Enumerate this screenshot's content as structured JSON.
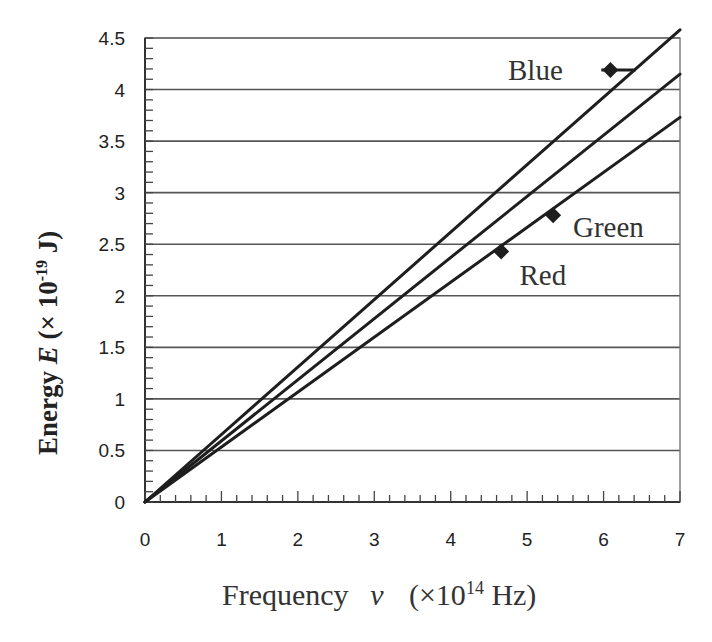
{
  "chart_data": {
    "type": "line",
    "title": "",
    "xlabel": "Frequency  ν  (×10¹⁴ Hz)",
    "xlabel_parts": {
      "main": "Frequency",
      "symbol": "ν",
      "unit_prefix": "(×10",
      "exp": "14",
      "unit_suffix": " Hz)"
    },
    "ylabel": "Energy E (×10⁻¹⁹ J)",
    "ylabel_parts": {
      "main": "Energy ",
      "symbol": "E",
      "unit_prefix": " (× 10",
      "exp": "-19",
      "unit_suffix": " J)"
    },
    "xlim": [
      0,
      7
    ],
    "ylim": [
      0,
      4.5
    ],
    "xticks": [
      0,
      1,
      2,
      3,
      4,
      5,
      6,
      7
    ],
    "yticks": [
      0,
      0.5,
      1,
      1.5,
      2,
      2.5,
      3,
      3.5,
      4,
      4.5
    ],
    "ytick_labels": [
      "0",
      "0.5",
      "1",
      "1.5",
      "2",
      "2.5",
      "3",
      "3.5",
      "4",
      "4.5"
    ],
    "x_minor_step": 0.2,
    "y_minor_step": 0.1,
    "grid": {
      "horizontal": true,
      "vertical": false
    },
    "series": [
      {
        "name": "line-1",
        "type": "line",
        "x": [
          0,
          7
        ],
        "y": [
          0,
          4.58
        ]
      },
      {
        "name": "line-2",
        "type": "line",
        "x": [
          0,
          7
        ],
        "y": [
          0,
          4.15
        ]
      },
      {
        "name": "line-3",
        "type": "line",
        "x": [
          0,
          7
        ],
        "y": [
          0,
          3.73
        ]
      }
    ],
    "points": [
      {
        "name": "Blue",
        "x": 6.09,
        "y": 4.19,
        "xerr": [
          5.97,
          6.42
        ],
        "label_x": 4.75,
        "label_y": 4.19
      },
      {
        "name": "Green",
        "x": 5.34,
        "y": 2.78,
        "label_x": 5.6,
        "label_y": 2.67
      },
      {
        "name": "Red",
        "x": 4.66,
        "y": 2.43,
        "label_x": 4.9,
        "label_y": 2.2
      }
    ]
  },
  "colors": {
    "line": "#1e1e1e",
    "grid": "#555555",
    "frame": "#777777",
    "text": "#222222"
  }
}
